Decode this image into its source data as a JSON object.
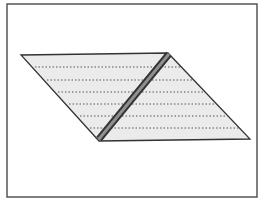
{
  "diagram": {
    "title": "",
    "frame": {
      "x": 7,
      "y": 4,
      "width": 250,
      "height": 193,
      "stroke": "#555555"
    },
    "parallelogram": {
      "points": [
        [
          21,
          55
        ],
        [
          168,
          53
        ],
        [
          250,
          139
        ],
        [
          99,
          141
        ]
      ],
      "fill": "#ebebeb",
      "stroke": "#333333"
    },
    "dotted_lines": {
      "color": "#555555",
      "rows": [
        {
          "y": 67,
          "x1": 35,
          "x2": 181
        },
        {
          "y": 80,
          "x1": 47,
          "x2": 193
        },
        {
          "y": 92,
          "x1": 58,
          "x2": 204
        },
        {
          "y": 104,
          "x1": 69,
          "x2": 216
        },
        {
          "y": 116,
          "x1": 80,
          "x2": 228
        },
        {
          "y": 128,
          "x1": 90,
          "x2": 239
        }
      ]
    },
    "strip": {
      "from": [
        99,
        139
      ],
      "to": [
        169,
        54
      ],
      "outer_color": "#333333",
      "inner_color": "#8f8f8f",
      "outer_width": 7,
      "inner_width": 3
    }
  }
}
